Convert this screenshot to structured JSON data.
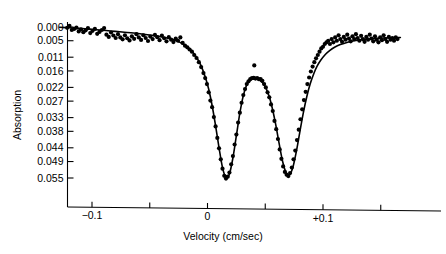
{
  "chart_data": {
    "type": "scatter",
    "title": "",
    "subtitle": "",
    "xlabel": "Velocity (cm/sec)",
    "ylabel": "Absorption",
    "grid": false,
    "legend": null,
    "axis_direction_note": "y-axis increases downward (absorption dips plotted downward)",
    "xlim": [
      -0.128,
      0.167
    ],
    "ylim": [
      0.0,
      0.0583
    ],
    "xticks": [
      {
        "value": -0.1,
        "label": "−0.1",
        "labeled": true
      },
      {
        "value": -0.05,
        "label": "",
        "labeled": false
      },
      {
        "value": 0.0,
        "label": "0",
        "labeled": true
      },
      {
        "value": 0.05,
        "label": "",
        "labeled": false
      },
      {
        "value": 0.1,
        "label": "+0.1",
        "labeled": true
      },
      {
        "value": 0.15,
        "label": "",
        "labeled": false
      }
    ],
    "yticks": [
      {
        "value": 0.0,
        "label": "0.000"
      },
      {
        "value": 0.005,
        "label": "0.005"
      },
      {
        "value": 0.011,
        "label": "0.011"
      },
      {
        "value": 0.016,
        "label": "0.016"
      },
      {
        "value": 0.022,
        "label": "0.022"
      },
      {
        "value": 0.027,
        "label": "0.027"
      },
      {
        "value": 0.033,
        "label": "0.033"
      },
      {
        "value": 0.038,
        "label": "0.038"
      },
      {
        "value": 0.044,
        "label": "0.044"
      },
      {
        "value": 0.049,
        "label": "0.049"
      },
      {
        "value": 0.055,
        "label": "0.055"
      }
    ],
    "fit_model": {
      "description": "Two Lorentzian absorption lines plus sloping baseline",
      "baseline": {
        "intercept_at_xmin": 0.0003,
        "slope_per_unit_x": 0.0145
      },
      "peaks": [
        {
          "name": "peak-1",
          "center": 0.013,
          "depth": 0.0555,
          "hwhm": 0.0125
        },
        {
          "name": "peak-2",
          "center": 0.0695,
          "depth": 0.0545,
          "hwhm": 0.0125
        }
      ],
      "central_maximum": {
        "x": 0.041,
        "y": 0.019
      }
    },
    "fit_curve": {
      "name": "fitted-lorentzian-doublet",
      "color": "#000000",
      "width": 1.6,
      "points": [
        [
          -0.128,
          0.0001
        ],
        [
          -0.12,
          0.0003
        ],
        [
          -0.112,
          0.0005
        ],
        [
          -0.104,
          0.0007
        ],
        [
          -0.096,
          0.001
        ],
        [
          -0.088,
          0.0013
        ],
        [
          -0.08,
          0.0016
        ],
        [
          -0.072,
          0.0019
        ],
        [
          -0.064,
          0.0022
        ],
        [
          -0.056,
          0.0026
        ],
        [
          -0.048,
          0.003
        ],
        [
          -0.042,
          0.0034
        ],
        [
          -0.036,
          0.0039
        ],
        [
          -0.03,
          0.0046
        ],
        [
          -0.026,
          0.0052
        ],
        [
          -0.022,
          0.006
        ],
        [
          -0.018,
          0.0071
        ],
        [
          -0.014,
          0.0086
        ],
        [
          -0.01,
          0.0107
        ],
        [
          -0.006,
          0.0137
        ],
        [
          -0.002,
          0.0181
        ],
        [
          0.001,
          0.0226
        ],
        [
          0.004,
          0.0286
        ],
        [
          0.007,
          0.036
        ],
        [
          0.01,
          0.044
        ],
        [
          0.013,
          0.0512
        ],
        [
          0.016,
          0.0548
        ],
        [
          0.019,
          0.0535
        ],
        [
          0.022,
          0.0477
        ],
        [
          0.025,
          0.0396
        ],
        [
          0.028,
          0.0314
        ],
        [
          0.031,
          0.025
        ],
        [
          0.034,
          0.021
        ],
        [
          0.037,
          0.0192
        ],
        [
          0.041,
          0.0188
        ],
        [
          0.045,
          0.0193
        ],
        [
          0.049,
          0.021
        ],
        [
          0.053,
          0.0248
        ],
        [
          0.056,
          0.0294
        ],
        [
          0.059,
          0.0354
        ],
        [
          0.062,
          0.0424
        ],
        [
          0.065,
          0.0489
        ],
        [
          0.068,
          0.053
        ],
        [
          0.071,
          0.0538
        ],
        [
          0.074,
          0.051
        ],
        [
          0.077,
          0.0452
        ],
        [
          0.08,
          0.0381
        ],
        [
          0.083,
          0.0312
        ],
        [
          0.086,
          0.0253
        ],
        [
          0.089,
          0.0206
        ],
        [
          0.092,
          0.017
        ],
        [
          0.095,
          0.0142
        ],
        [
          0.098,
          0.0121
        ],
        [
          0.102,
          0.01
        ],
        [
          0.106,
          0.0085
        ],
        [
          0.11,
          0.0074
        ],
        [
          0.115,
          0.0064
        ],
        [
          0.12,
          0.0057
        ],
        [
          0.126,
          0.0051
        ],
        [
          0.132,
          0.0047
        ],
        [
          0.138,
          0.0044
        ],
        [
          0.145,
          0.0042
        ],
        [
          0.152,
          0.004
        ],
        [
          0.16,
          0.0039
        ],
        [
          0.167,
          0.0038
        ]
      ]
    },
    "data_points": {
      "name": "measured-absorption-points",
      "marker": "filled-circle",
      "color": "#000000",
      "size": 3.1,
      "points": [
        [
          -0.1275,
          -0.0018
        ],
        [
          -0.1255,
          0.0002
        ],
        [
          -0.1235,
          0.001
        ],
        [
          -0.1215,
          0.0003
        ],
        [
          -0.1195,
          -0.0004
        ],
        [
          -0.1175,
          0.0011
        ],
        [
          -0.1155,
          0.0007
        ],
        [
          -0.1135,
          0.0002
        ],
        [
          -0.1115,
          0.0016
        ],
        [
          -0.1095,
          0.0009
        ],
        [
          -0.1075,
          0.0019
        ],
        [
          -0.1055,
          0.0012
        ],
        [
          -0.1035,
          0.0004
        ],
        [
          -0.1015,
          0.0022
        ],
        [
          -0.0995,
          0.0014
        ],
        [
          -0.0975,
          0.0007
        ],
        [
          -0.0955,
          0.0025
        ],
        [
          -0.0935,
          0.0018
        ],
        [
          -0.0915,
          0.0011
        ],
        [
          -0.0895,
          0.0004
        ],
        [
          -0.0875,
          0.0028
        ],
        [
          -0.0855,
          0.0036
        ],
        [
          -0.0835,
          0.002
        ],
        [
          -0.0815,
          0.0031
        ],
        [
          -0.0795,
          0.004
        ],
        [
          -0.0775,
          0.0026
        ],
        [
          -0.0755,
          0.0038
        ],
        [
          -0.0735,
          0.0045
        ],
        [
          -0.0715,
          0.003
        ],
        [
          -0.0695,
          0.0041
        ],
        [
          -0.0675,
          0.0049
        ],
        [
          -0.0655,
          0.0034
        ],
        [
          -0.0635,
          0.0043
        ],
        [
          -0.0615,
          0.0026
        ],
        [
          -0.0595,
          0.0038
        ],
        [
          -0.0575,
          0.0047
        ],
        [
          -0.0555,
          0.003
        ],
        [
          -0.0535,
          0.004
        ],
        [
          -0.0515,
          0.0051
        ],
        [
          -0.0495,
          0.0035
        ],
        [
          -0.0475,
          0.0044
        ],
        [
          -0.0455,
          0.0029
        ],
        [
          -0.0435,
          0.0037
        ],
        [
          -0.0415,
          0.0048
        ],
        [
          -0.0395,
          0.0031
        ],
        [
          -0.0375,
          0.0041
        ],
        [
          -0.0355,
          0.0052
        ],
        [
          -0.0335,
          0.0037
        ],
        [
          -0.0315,
          0.0046
        ],
        [
          -0.0295,
          0.0055
        ],
        [
          -0.0275,
          0.0042
        ],
        [
          -0.0255,
          0.005
        ],
        [
          -0.0235,
          0.0038
        ],
        [
          -0.0215,
          0.0058
        ],
        [
          -0.0195,
          0.0068
        ],
        [
          -0.0175,
          0.0074
        ],
        [
          -0.0155,
          0.0082
        ],
        [
          -0.0135,
          0.009
        ],
        [
          -0.0115,
          0.0102
        ],
        [
          -0.0095,
          0.0113
        ],
        [
          -0.0075,
          0.0128
        ],
        [
          -0.0055,
          0.0146
        ],
        [
          -0.0035,
          0.0168
        ],
        [
          -0.002,
          0.0186
        ],
        [
          -0.0005,
          0.0208
        ],
        [
          0.001,
          0.0238
        ],
        [
          0.0025,
          0.0268
        ],
        [
          0.004,
          0.0292
        ],
        [
          0.0055,
          0.0328
        ],
        [
          0.007,
          0.0362
        ],
        [
          0.0085,
          0.0404
        ],
        [
          0.01,
          0.0442
        ],
        [
          0.0115,
          0.0482
        ],
        [
          0.013,
          0.0516
        ],
        [
          0.0145,
          0.0542
        ],
        [
          0.016,
          0.0552
        ],
        [
          0.0175,
          0.0545
        ],
        [
          0.019,
          0.053
        ],
        [
          0.0205,
          0.05
        ],
        [
          0.022,
          0.047
        ],
        [
          0.0235,
          0.0428
        ],
        [
          0.025,
          0.0392
        ],
        [
          0.0265,
          0.0348
        ],
        [
          0.028,
          0.0312
        ],
        [
          0.0295,
          0.0276
        ],
        [
          0.031,
          0.0248
        ],
        [
          0.0325,
          0.0226
        ],
        [
          0.034,
          0.0208
        ],
        [
          0.0355,
          0.0198
        ],
        [
          0.037,
          0.019
        ],
        [
          0.0385,
          0.0186
        ],
        [
          0.04,
          0.0185
        ],
        [
          0.0405,
          0.014
        ],
        [
          0.0415,
          0.0188
        ],
        [
          0.043,
          0.0186
        ],
        [
          0.0445,
          0.019
        ],
        [
          0.046,
          0.019
        ],
        [
          0.0475,
          0.0196
        ],
        [
          0.049,
          0.0208
        ],
        [
          0.0505,
          0.022
        ],
        [
          0.052,
          0.0238
        ],
        [
          0.0535,
          0.0256
        ],
        [
          0.055,
          0.0282
        ],
        [
          0.0565,
          0.0306
        ],
        [
          0.058,
          0.0342
        ],
        [
          0.0595,
          0.0372
        ],
        [
          0.061,
          0.0408
        ],
        [
          0.0625,
          0.0446
        ],
        [
          0.064,
          0.048
        ],
        [
          0.0655,
          0.0508
        ],
        [
          0.067,
          0.0528
        ],
        [
          0.0685,
          0.0538
        ],
        [
          0.07,
          0.0543
        ],
        [
          0.0715,
          0.0532
        ],
        [
          0.073,
          0.0512
        ],
        [
          0.0745,
          0.0482
        ],
        [
          0.076,
          0.045
        ],
        [
          0.0775,
          0.0412
        ],
        [
          0.079,
          0.0374
        ],
        [
          0.0805,
          0.0336
        ],
        [
          0.082,
          0.03
        ],
        [
          0.0835,
          0.0266
        ],
        [
          0.085,
          0.0236
        ],
        [
          0.0865,
          0.0208
        ],
        [
          0.088,
          0.0184
        ],
        [
          0.0895,
          0.0162
        ],
        [
          0.091,
          0.0144
        ],
        [
          0.0925,
          0.0128
        ],
        [
          0.094,
          0.0114
        ],
        [
          0.0955,
          0.0102
        ],
        [
          0.097,
          0.009
        ],
        [
          0.0985,
          0.0078
        ],
        [
          0.1,
          0.0072
        ],
        [
          0.1015,
          0.0062
        ],
        [
          0.103,
          0.0056
        ],
        [
          0.1045,
          0.005
        ],
        [
          0.106,
          0.0062
        ],
        [
          0.1075,
          0.0044
        ],
        [
          0.109,
          0.0056
        ],
        [
          0.1105,
          0.0038
        ],
        [
          0.112,
          0.005
        ],
        [
          0.1135,
          0.003
        ],
        [
          0.115,
          0.0044
        ],
        [
          0.1165,
          0.0054
        ],
        [
          0.118,
          0.0036
        ],
        [
          0.1195,
          0.0046
        ],
        [
          0.121,
          0.0028
        ],
        [
          0.1225,
          0.0042
        ],
        [
          0.124,
          0.0052
        ],
        [
          0.1255,
          0.0034
        ],
        [
          0.127,
          0.0044
        ],
        [
          0.1285,
          0.0026
        ],
        [
          0.13,
          0.004
        ],
        [
          0.1315,
          0.005
        ],
        [
          0.133,
          0.0032
        ],
        [
          0.1345,
          0.0044
        ],
        [
          0.136,
          0.0054
        ],
        [
          0.1375,
          0.0036
        ],
        [
          0.139,
          0.0046
        ],
        [
          0.1405,
          0.0028
        ],
        [
          0.142,
          0.0042
        ],
        [
          0.1435,
          0.0052
        ],
        [
          0.145,
          0.0034
        ],
        [
          0.1465,
          0.0046
        ],
        [
          0.148,
          0.0056
        ],
        [
          0.1495,
          0.0038
        ],
        [
          0.151,
          0.0048
        ],
        [
          0.1525,
          0.003
        ],
        [
          0.154,
          0.0044
        ],
        [
          0.1555,
          0.0054
        ],
        [
          0.157,
          0.0036
        ],
        [
          0.1585,
          0.0046
        ],
        [
          0.16,
          0.004
        ],
        [
          0.1615,
          0.005
        ],
        [
          0.163,
          0.0038
        ],
        [
          0.1645,
          0.0044
        ]
      ]
    }
  },
  "colors": {
    "axis": "#000000",
    "data": "#000000",
    "curve": "#000000",
    "background": "#ffffff"
  }
}
